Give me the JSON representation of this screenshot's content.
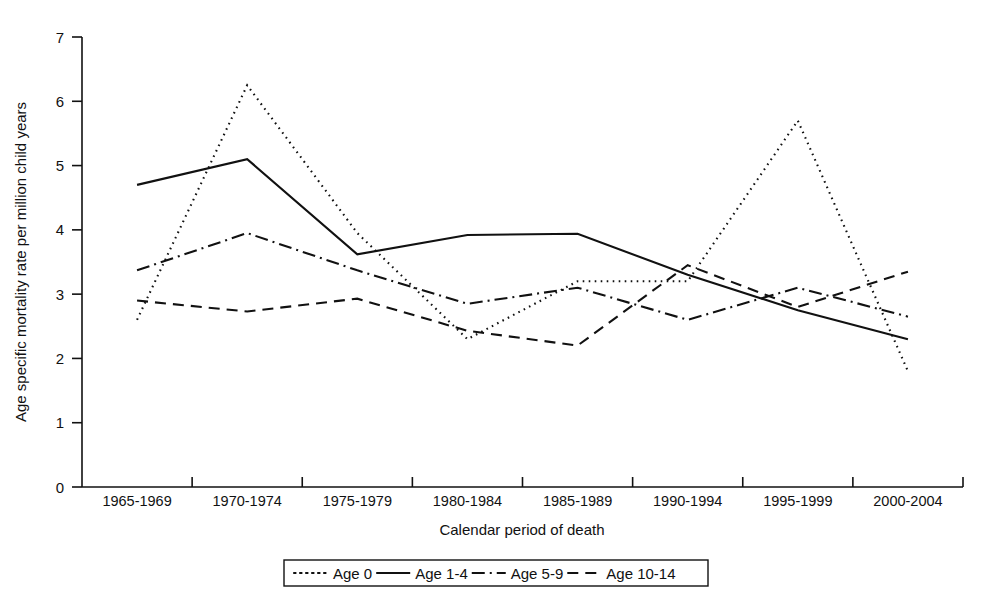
{
  "chart_data": {
    "type": "line",
    "title": "",
    "xlabel": "Calendar period of death",
    "ylabel": "Age specific mortality rate per million child years",
    "categories": [
      "1965-1969",
      "1970-1974",
      "1975-1979",
      "1980-1984",
      "1985-1989",
      "1990-1994",
      "1995-1999",
      "2000-2004"
    ],
    "ylim": [
      0,
      7
    ],
    "yticks": [
      "0",
      "1",
      "2",
      "3",
      "4",
      "5",
      "6",
      "7"
    ],
    "grid": false,
    "legend_position": "bottom",
    "series": [
      {
        "name": "Age 0",
        "style": "dotted",
        "values": [
          2.6,
          6.25,
          3.95,
          2.3,
          3.2,
          3.2,
          5.7,
          1.8
        ]
      },
      {
        "name": "Age 1-4",
        "style": "solid",
        "values": [
          4.7,
          5.1,
          3.62,
          3.92,
          3.94,
          3.3,
          2.75,
          2.3
        ]
      },
      {
        "name": "Age 5-9",
        "style": "dash-dot",
        "values": [
          3.37,
          3.95,
          3.37,
          2.85,
          3.1,
          2.6,
          3.1,
          2.65
        ]
      },
      {
        "name": "Age 10-14",
        "style": "dashed",
        "values": [
          2.9,
          2.73,
          2.93,
          2.43,
          2.2,
          3.45,
          2.8,
          3.35
        ]
      }
    ]
  },
  "axes": {
    "y_title": "Age specific mortality rate per million child years",
    "x_title": "Calendar period of death"
  },
  "legend": {
    "entries": [
      {
        "label": "Age 0",
        "style": "dotted"
      },
      {
        "label": "Age 1-4",
        "style": "solid"
      },
      {
        "label": "Age 5-9",
        "style": "dash-dot"
      },
      {
        "label": "Age 10-14",
        "style": "dashed"
      }
    ]
  }
}
